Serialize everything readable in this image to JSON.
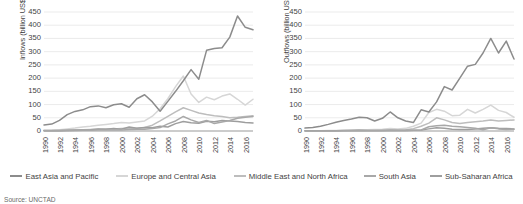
{
  "chart_data": [
    {
      "type": "line",
      "title": "",
      "panel": "left",
      "xlabel": "",
      "ylabel": "Inflows (billion US$)",
      "ylim": [
        0,
        450
      ],
      "ytick_labels": [
        "450",
        "400",
        "350",
        "300",
        "250",
        "200",
        "150",
        "100",
        "50",
        "0"
      ],
      "ytick_values": [
        450,
        400,
        350,
        300,
        250,
        200,
        150,
        100,
        50,
        0
      ],
      "grid": true,
      "legend_position": "bottom",
      "x": [
        1990,
        1991,
        1992,
        1993,
        1994,
        1995,
        1996,
        1997,
        1998,
        1999,
        2000,
        2001,
        2002,
        2003,
        2004,
        2005,
        2006,
        2007,
        2008,
        2009,
        2010,
        2011,
        2012,
        2013,
        2014,
        2015,
        2016,
        2017
      ],
      "xtick_labels": [
        "1990",
        "1992",
        "1994",
        "1996",
        "1998",
        "2000",
        "2002",
        "2004",
        "2006",
        "2008",
        "2010",
        "2012",
        "2014",
        "2016"
      ],
      "series": [
        {
          "name": "East Asia and Pacific",
          "color": "#8c8c8c",
          "values": [
            23,
            26,
            40,
            62,
            74,
            80,
            92,
            95,
            88,
            99,
            103,
            90,
            122,
            137,
            110,
            75,
            112,
            150,
            190,
            232,
            196,
            305,
            312,
            315,
            355,
            435,
            392,
            383
          ]
        },
        {
          "name": "Europe and Central Asia",
          "color": "#d6d6d6",
          "values": [
            2,
            3,
            5,
            8,
            11,
            15,
            18,
            22,
            25,
            28,
            32,
            30,
            34,
            38,
            56,
            84,
            122,
            168,
            208,
            140,
            108,
            128,
            118,
            132,
            140,
            120,
            98,
            120
          ]
        },
        {
          "name": "Middle East and North Africa",
          "color": "#bdbdbd",
          "values": [
            3,
            3,
            4,
            5,
            5,
            5,
            6,
            7,
            8,
            8,
            9,
            10,
            10,
            13,
            22,
            38,
            55,
            72,
            88,
            78,
            68,
            62,
            58,
            55,
            50,
            52,
            55,
            58
          ]
        },
        {
          "name": "South Asia",
          "color": "#a8a8a8",
          "values": [
            0.5,
            0.6,
            1,
            1.5,
            2,
            2.5,
            3,
            4,
            4,
            4,
            4,
            6,
            7,
            7,
            9,
            13,
            27,
            38,
            55,
            42,
            32,
            40,
            28,
            34,
            40,
            48,
            52,
            55
          ]
        },
        {
          "name": "Sub-Saharan Africa",
          "color": "#9e9e9e",
          "values": [
            1,
            1,
            1,
            2,
            3,
            4,
            5,
            8,
            7,
            9,
            7,
            15,
            10,
            13,
            12,
            18,
            15,
            28,
            36,
            31,
            29,
            37,
            35,
            40,
            38,
            36,
            32,
            30
          ]
        }
      ]
    },
    {
      "type": "line",
      "title": "",
      "panel": "right",
      "xlabel": "",
      "ylabel": "Outflows (billion US$)",
      "ylim": [
        0,
        450
      ],
      "ytick_labels": [
        "450",
        "400",
        "350",
        "300",
        "250",
        "200",
        "150",
        "100",
        "50",
        "0"
      ],
      "ytick_values": [
        450,
        400,
        350,
        300,
        250,
        200,
        150,
        100,
        50,
        0
      ],
      "grid": true,
      "legend_position": "bottom",
      "x": [
        1990,
        1991,
        1992,
        1993,
        1994,
        1995,
        1996,
        1997,
        1998,
        1999,
        2000,
        2001,
        2002,
        2003,
        2004,
        2005,
        2006,
        2007,
        2008,
        2009,
        2010,
        2011,
        2012,
        2013,
        2014,
        2015,
        2016,
        2017
      ],
      "xtick_labels": [
        "1990",
        "1992",
        "1994",
        "1996",
        "1998",
        "2000",
        "2002",
        "2004",
        "2006",
        "2008",
        "2010",
        "2012",
        "2014",
        "2016"
      ],
      "series": [
        {
          "name": "East Asia and Pacific",
          "color": "#8c8c8c",
          "values": [
            11,
            13,
            18,
            25,
            33,
            40,
            45,
            52,
            50,
            38,
            48,
            72,
            50,
            38,
            32,
            80,
            72,
            110,
            168,
            155,
            200,
            245,
            252,
            295,
            350,
            295,
            340,
            272
          ]
        },
        {
          "name": "Europe and Central Asia",
          "color": "#d6d6d6",
          "values": [
            1,
            1,
            1,
            2,
            2,
            3,
            4,
            5,
            5,
            6,
            7,
            9,
            8,
            10,
            18,
            30,
            70,
            82,
            75,
            58,
            60,
            82,
            68,
            82,
            98,
            78,
            70,
            52
          ]
        },
        {
          "name": "Middle East and North Africa",
          "color": "#bdbdbd",
          "values": [
            1,
            1,
            1,
            1,
            1,
            1,
            2,
            2,
            2,
            2,
            3,
            4,
            4,
            5,
            9,
            18,
            30,
            50,
            42,
            32,
            28,
            32,
            35,
            38,
            42,
            38,
            40,
            42
          ]
        },
        {
          "name": "South Asia",
          "color": "#a8a8a8",
          "values": [
            0.2,
            0.2,
            0.3,
            0.3,
            0.4,
            0.5,
            0.6,
            0.8,
            0.5,
            0.5,
            1,
            1.5,
            2,
            2,
            3,
            4,
            16,
            20,
            22,
            18,
            16,
            13,
            10,
            5,
            12,
            8,
            6,
            7
          ]
        },
        {
          "name": "Sub-Saharan Africa",
          "color": "#9e9e9e",
          "values": [
            0.5,
            0.5,
            0.5,
            1,
            1,
            2,
            2,
            3,
            2,
            2,
            2,
            3,
            2,
            2,
            3,
            4,
            8,
            12,
            10,
            7,
            6,
            6,
            8,
            10,
            12,
            10,
            9,
            8
          ]
        }
      ]
    }
  ],
  "legend": {
    "items": [
      {
        "label": "East Asia and Pacific",
        "color": "#8c8c8c"
      },
      {
        "label": "Europe and Central Asia",
        "color": "#d6d6d6"
      },
      {
        "label": "Middle East and North Africa",
        "color": "#bdbdbd"
      },
      {
        "label": "South Asia",
        "color": "#a8a8a8"
      },
      {
        "label": "Sub-Saharan Africa",
        "color": "#9e9e9e"
      }
    ]
  },
  "source": {
    "text": "Source: UNCTAD"
  },
  "style": {
    "grid_color": "#e3e3e3",
    "axis_color": "#9a9a9a",
    "text_color": "#3f3f3f"
  }
}
